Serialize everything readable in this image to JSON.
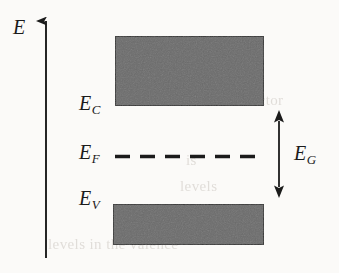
{
  "figure": {
    "type": "energy-band-diagram",
    "background_color": "#fbfaf8",
    "ink_color": "#1b1b1b",
    "band_fill_color": "#6b6b6b",
    "band_border_color": "#3a3a3a",
    "width": 339,
    "height": 273
  },
  "axis": {
    "label_main": "E",
    "label_sub": "",
    "orientation": "vertical",
    "arrow_direction": "up",
    "x": 46,
    "y_top": 20,
    "y_bottom": 258
  },
  "labels": {
    "conduction_band_edge": {
      "main": "E",
      "sub": "C"
    },
    "fermi_level": {
      "main": "E",
      "sub": "F"
    },
    "valence_band_edge": {
      "main": "E",
      "sub": "V"
    },
    "band_gap": {
      "main": "E",
      "sub": "G"
    },
    "energy_axis": {
      "main": "E",
      "sub": ""
    }
  },
  "bands": [
    {
      "name": "conduction-band",
      "x": 115,
      "y": 36,
      "width": 149,
      "height": 70,
      "fill": "#6b6b6b"
    },
    {
      "name": "valence-band",
      "x": 113,
      "y": 204,
      "width": 151,
      "height": 41,
      "fill": "#6b6b6b"
    }
  ],
  "fermi_line": {
    "name": "fermi-level-dashed-line",
    "y": 156,
    "x_start": 115,
    "x_end": 262,
    "dash_count": 6,
    "style": "dashed"
  },
  "gap_arrow": {
    "name": "band-gap-arrow",
    "x": 279,
    "y_top": 110,
    "y_bottom": 198,
    "heads": "both"
  },
  "ghost_text": [
    {
      "text": "which",
      "x": 196,
      "y": 78
    },
    {
      "text": "semiconductor",
      "x": 190,
      "y": 99
    },
    {
      "text": "is",
      "x": 186,
      "y": 160
    },
    {
      "text": "levels",
      "x": 180,
      "y": 186
    },
    {
      "text": "to",
      "x": 188,
      "y": 210
    },
    {
      "text": "levels in the valence",
      "x": 48,
      "y": 243
    }
  ]
}
